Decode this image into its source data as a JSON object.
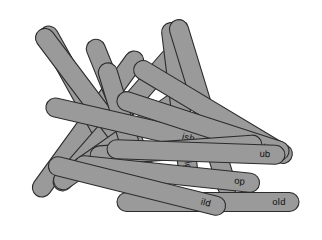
{
  "scene": {
    "title": "Pile of labeled craft sticks",
    "background_color": "#ffffff",
    "width": 322,
    "height": 240
  },
  "stick_style": {
    "fill_color": "#9a9a9a",
    "outline_color": "#2b2b2b",
    "label_color": "#101010"
  },
  "sticks": [
    {
      "id": "stick-blank-1",
      "label": "",
      "cx": 88,
      "cy": 124,
      "length": 176,
      "width": 19,
      "angle": -54
    },
    {
      "id": "stick-ent",
      "label": "ent",
      "cx": 80,
      "cy": 92,
      "length": 148,
      "width": 19,
      "angle": 61
    },
    {
      "id": "stick-blank-2",
      "label": "",
      "cx": 116,
      "cy": 120,
      "length": 182,
      "width": 19,
      "angle": -49
    },
    {
      "id": "stick-est",
      "label": "est",
      "cx": 94,
      "cy": 103,
      "length": 182,
      "width": 19,
      "angle": 53
    },
    {
      "id": "stick-blank-3",
      "label": "",
      "cx": 122,
      "cy": 139,
      "length": 163,
      "width": 19,
      "angle": -35
    },
    {
      "id": "stick-ay",
      "label": "ay",
      "cx": 123,
      "cy": 116,
      "length": 164,
      "width": 19,
      "angle": 68
    },
    {
      "id": "stick-an",
      "label": "an",
      "cx": 127,
      "cy": 135,
      "length": 150,
      "width": 19,
      "angle": 73
    },
    {
      "id": "stick-ig",
      "label": "ig",
      "cx": 180,
      "cy": 104,
      "length": 164,
      "width": 19,
      "angle": 83
    },
    {
      "id": "stick-all",
      "label": "all",
      "cx": 203,
      "cy": 108,
      "length": 184,
      "width": 19,
      "angle": 73
    },
    {
      "id": "stick-ish",
      "label": "ish",
      "cx": 127,
      "cy": 124,
      "length": 166,
      "width": 19,
      "angle": 13
    },
    {
      "id": "stick-et",
      "label": "et",
      "cx": 213,
      "cy": 112,
      "length": 182,
      "width": 19,
      "angle": 31
    },
    {
      "id": "stick-ust",
      "label": "ust",
      "cx": 203,
      "cy": 126,
      "length": 180,
      "width": 19,
      "angle": 18
    },
    {
      "id": "stick-blank-4",
      "label": "",
      "cx": 176,
      "cy": 150,
      "length": 172,
      "width": 19,
      "angle": -4
    },
    {
      "id": "stick-ub",
      "label": "ub",
      "cx": 196,
      "cy": 152,
      "length": 178,
      "width": 19,
      "angle": 2
    },
    {
      "id": "stick-op",
      "label": "op",
      "cx": 167,
      "cy": 174,
      "length": 186,
      "width": 19,
      "angle": 6
    },
    {
      "id": "stick-old",
      "label": "old",
      "cx": 208,
      "cy": 202,
      "length": 182,
      "width": 19,
      "angle": 0
    },
    {
      "id": "stick-ild",
      "label": "ild",
      "cx": 137,
      "cy": 186,
      "length": 182,
      "width": 19,
      "angle": 14
    }
  ]
}
